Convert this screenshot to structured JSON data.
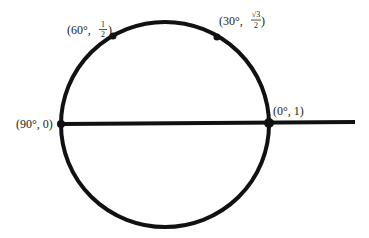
{
  "diagram": {
    "colors": {
      "stroke": "#111111",
      "text": "#222222",
      "background": "#ffffff"
    },
    "points": [
      {
        "id": "p60",
        "angle": "60°",
        "value_text": "1/2",
        "label_prefix": "(60°, ",
        "num": "1",
        "den": "2",
        "label_suffix": ")"
      },
      {
        "id": "p30",
        "angle": "30°",
        "value_text": "√3/2",
        "label_prefix": "(30°, ",
        "num": "√3",
        "den": "2",
        "label_suffix": ")"
      },
      {
        "id": "p90",
        "angle": "90°",
        "value_text": "0",
        "label": "(90°, 0)"
      },
      {
        "id": "p0",
        "angle": "0°",
        "value_text": "1",
        "label": "(0°, 1)"
      }
    ]
  }
}
